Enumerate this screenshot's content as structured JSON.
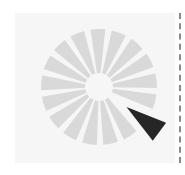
{
  "spinner": {
    "icon": "loading-spinner-icon",
    "segment_count": 17,
    "active_segment_angle_deg": 36,
    "center": [
      99,
      87
    ],
    "inner_radius": 14,
    "outer_radius": 58,
    "active_outer_radius": 76,
    "colors": {
      "segment": "#d9d9d9",
      "active_segment": "#262626",
      "panel": "#f6f6f6",
      "divider": "#8a8a8a"
    }
  }
}
